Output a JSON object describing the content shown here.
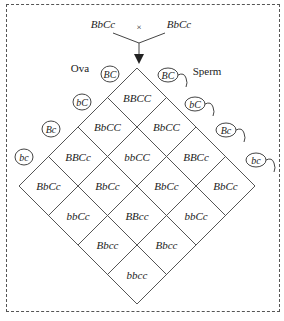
{
  "cross": {
    "parent_left": "BbCc",
    "symbol": "×",
    "parent_right": "BbCc"
  },
  "labels": {
    "ova": "Ova",
    "sperm": "Sperm"
  },
  "ova": [
    "BC",
    "bC",
    "Bc",
    "bc"
  ],
  "sperm": [
    "BC",
    "bC",
    "Bc",
    "bc"
  ],
  "grid": [
    [
      "BBCC",
      "BbCC",
      "BBCc",
      "BbCc"
    ],
    [
      "BbCC",
      "bbCC",
      "BbCc",
      "bbCc"
    ],
    [
      "BBCc",
      "BbCc",
      "BBcc",
      "Bbcc"
    ],
    [
      "BbCc",
      "bbCc",
      "Bbcc",
      "bbcc"
    ]
  ],
  "colors": {
    "line": "#555555",
    "text": "#222222",
    "background": "#ffffff"
  }
}
